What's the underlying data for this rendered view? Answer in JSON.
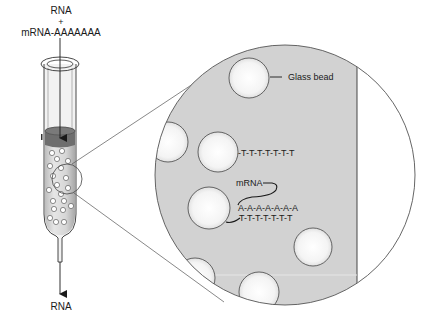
{
  "diagram": {
    "input_label_top": "RNA",
    "input_plus": "+",
    "input_label_mrna": "mRNA-AAAAAAA",
    "output_label": "RNA",
    "callouts": {
      "glass_bead": "Glass bead",
      "oligo_dt": "-T-T-T-T-T-T-T",
      "mrna": "mRNA",
      "poly_a": "A-A-A-A-A-A-A",
      "hybrid_t": "T-T-T-T-T-T-T"
    },
    "colors": {
      "ink": "#1a1a1a",
      "matrix_gray": "#d2d2d2",
      "bead_fill": "#f7f7f7",
      "reservoir": "#6e6e6e",
      "zoom_outline": "#555555"
    }
  }
}
